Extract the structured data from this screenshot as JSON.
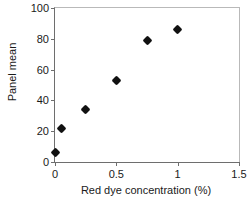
{
  "chart_data": {
    "type": "scatter",
    "title": "",
    "xlabel": "Red dye concentration (%)",
    "ylabel": "Panel mean",
    "xlim": [
      0,
      1.5
    ],
    "ylim": [
      0,
      100
    ],
    "xticks": [
      "0",
      "0.5",
      "1",
      "1.5"
    ],
    "xtick_values": [
      0,
      0.5,
      1,
      1.5
    ],
    "yticks": [
      "0",
      "20",
      "40",
      "60",
      "80",
      "100"
    ],
    "ytick_values": [
      0,
      20,
      40,
      60,
      80,
      100
    ],
    "grid": false,
    "legend": null,
    "marker": "diamond",
    "marker_color": "#111111",
    "series": [
      {
        "name": "Panel mean",
        "points": [
          {
            "x": 0,
            "y": 6
          },
          {
            "x": 0.05,
            "y": 22
          },
          {
            "x": 0.25,
            "y": 34
          },
          {
            "x": 0.5,
            "y": 53
          },
          {
            "x": 0.75,
            "y": 79
          },
          {
            "x": 1.0,
            "y": 86
          }
        ]
      }
    ]
  }
}
